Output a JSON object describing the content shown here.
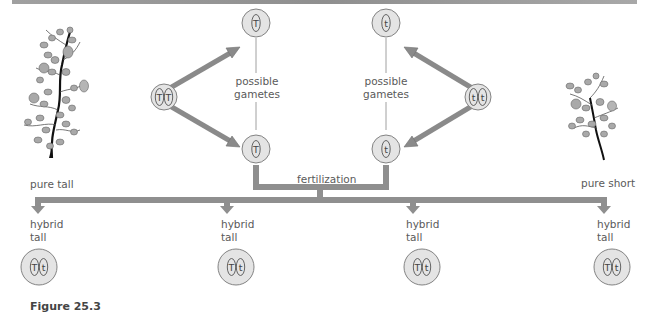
{
  "diagram": {
    "parents": [
      {
        "label": "pure tall",
        "genotype": [
          "T",
          "T"
        ],
        "plant": "tall-plant"
      },
      {
        "label": "pure short",
        "genotype": [
          "t",
          "t"
        ],
        "plant": "short-plant"
      }
    ],
    "gametes": {
      "left": {
        "label_line1": "possible",
        "label_line2": "gametes",
        "alleles": [
          "T",
          "T"
        ]
      },
      "right": {
        "label_line1": "possible",
        "label_line2": "gametes",
        "alleles": [
          "t",
          "t"
        ]
      }
    },
    "fertilization_label": "fertilization",
    "offspring": [
      {
        "label_line1": "hybrid",
        "label_line2": "tall",
        "genotype": [
          "T",
          "t"
        ]
      },
      {
        "label_line1": "hybrid",
        "label_line2": "tall",
        "genotype": [
          "T",
          "t"
        ]
      },
      {
        "label_line1": "hybrid",
        "label_line2": "tall",
        "genotype": [
          "T",
          "t"
        ]
      },
      {
        "label_line1": "hybrid",
        "label_line2": "tall",
        "genotype": [
          "T",
          "t"
        ]
      }
    ],
    "caption": "Figure 25.3",
    "colors": {
      "arrow": "#8a8a8a",
      "cell_fill": "#e4e4e4",
      "cell_stroke": "#777777",
      "rule": "#9a9a9a"
    }
  }
}
